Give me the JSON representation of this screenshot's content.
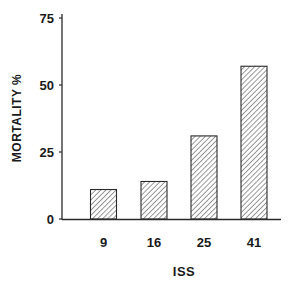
{
  "chart_data": {
    "type": "bar",
    "title": "",
    "xlabel": "ISS",
    "ylabel": "MORTALITY %",
    "categories": [
      "9",
      "16",
      "25",
      "41"
    ],
    "values": [
      11,
      14,
      31,
      57
    ],
    "ylim": [
      0,
      75
    ],
    "yticks": [
      0,
      25,
      50,
      75
    ],
    "grid": false,
    "legend": null,
    "bar_fill": "diagonal-hatch",
    "colors": {
      "ink": "#1a1a1a",
      "background": "#ffffff"
    }
  }
}
